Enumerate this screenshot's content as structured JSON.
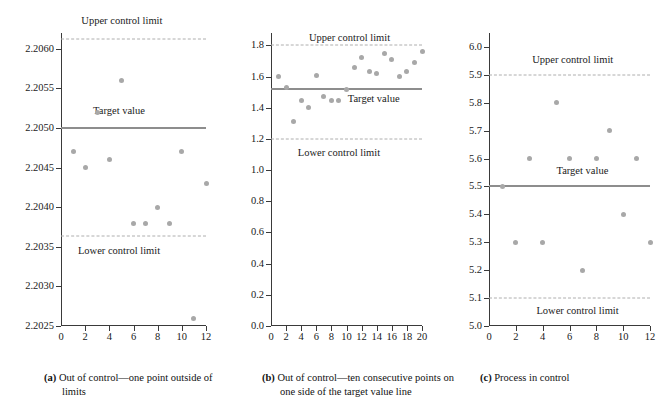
{
  "figure": {
    "background": "#ffffff",
    "point_color": "#a8a8a8",
    "target_line_color": "#8d8d8d",
    "limit_line_color": "#aeaeae",
    "axis_color": "#3a3a3a"
  },
  "labels": {
    "upper_control_limit": "Upper control limit",
    "lower_control_limit": "Lower control limit",
    "target_value": "Target value",
    "hours": "Hours"
  },
  "captions": {
    "a": {
      "label": "(a)",
      "text": "Out of control—one point outside of limits"
    },
    "b": {
      "label": "(b)",
      "text": "Out of control—ten consecutive points on one side of the target value line"
    },
    "c": {
      "label": "(c)",
      "text": "Process in control"
    }
  },
  "chart_data": [
    {
      "id": "panel-a",
      "type": "scatter",
      "title": "",
      "xlabel": "Hours",
      "ylabel": "",
      "xlim": [
        0,
        12
      ],
      "ylim": [
        2.2025,
        2.2062
      ],
      "xticks": [
        0,
        2,
        4,
        6,
        8,
        10,
        12
      ],
      "xticklabels": [
        "0",
        "2",
        "4",
        "6",
        "8",
        "10",
        "12"
      ],
      "yticks": [
        2.2025,
        2.203,
        2.2035,
        2.204,
        2.2045,
        2.205,
        2.2055,
        2.206
      ],
      "yticklabels": [
        "2.2025",
        "2.2030",
        "2.2035",
        "2.2040",
        "2.2045",
        "2.2050",
        "2.2055",
        "2.2060"
      ],
      "grid": false,
      "target_value": 2.205,
      "upper_control_limit": 2.20613,
      "lower_control_limit": 2.20364,
      "x": [
        1,
        2,
        3,
        4,
        5,
        6,
        7,
        8,
        9,
        10,
        11,
        12
      ],
      "values": [
        2.2047,
        2.2045,
        2.2052,
        2.2046,
        2.2056,
        2.2038,
        2.2038,
        2.204,
        2.2038,
        2.2047,
        2.2026,
        2.2043
      ],
      "annotations": [
        "Upper control limit",
        "Target value",
        "Lower control limit"
      ]
    },
    {
      "id": "panel-b",
      "type": "scatter",
      "title": "",
      "xlabel": "Hours",
      "ylabel": "",
      "xlim": [
        0,
        20
      ],
      "ylim": [
        0.0,
        1.88
      ],
      "xticks": [
        0,
        2,
        4,
        6,
        8,
        10,
        12,
        14,
        16,
        18,
        20
      ],
      "xticklabels": [
        "0",
        "2",
        "4",
        "6",
        "8",
        "10",
        "12",
        "14",
        "16",
        "18",
        "20"
      ],
      "yticks": [
        0.0,
        0.2,
        0.4,
        0.6,
        0.8,
        1.0,
        1.2,
        1.4,
        1.6,
        1.8
      ],
      "yticklabels": [
        "0.0",
        "0.2",
        "0.4",
        "0.6",
        "0.8",
        "1.0",
        "1.2",
        "1.4",
        "1.6",
        "1.8"
      ],
      "grid": false,
      "target_value": 1.52,
      "upper_control_limit": 1.8,
      "lower_control_limit": 1.2,
      "x": [
        1,
        2,
        3,
        4,
        5,
        6,
        7,
        8,
        9,
        10,
        11,
        12,
        13,
        14,
        15,
        16,
        17,
        18,
        19,
        20
      ],
      "values": [
        1.6,
        1.53,
        1.31,
        1.45,
        1.4,
        1.61,
        1.47,
        1.45,
        1.45,
        1.52,
        1.66,
        1.72,
        1.63,
        1.62,
        1.75,
        1.71,
        1.6,
        1.63,
        1.69,
        1.76
      ],
      "annotations": [
        "Upper control limit",
        "Target value",
        "Lower control limit"
      ]
    },
    {
      "id": "panel-c",
      "type": "scatter",
      "title": "",
      "xlabel": "Hours",
      "ylabel": "",
      "xlim": [
        0,
        12
      ],
      "ylim": [
        5.0,
        6.05
      ],
      "xticks": [
        0,
        2,
        4,
        6,
        8,
        10,
        12
      ],
      "xticklabels": [
        "0",
        "2",
        "4",
        "6",
        "8",
        "10",
        "12"
      ],
      "yticks": [
        5.0,
        5.1,
        5.2,
        5.3,
        5.4,
        5.5,
        5.6,
        5.7,
        5.8,
        5.9,
        6.0
      ],
      "yticklabels": [
        "5.0",
        "5.1",
        "5.2",
        "5.3",
        "5.4",
        "5.5",
        "5.6",
        "5.7",
        "5.8",
        "5.9",
        "6.0"
      ],
      "grid": false,
      "target_value": 5.5,
      "upper_control_limit": 5.9,
      "lower_control_limit": 5.1,
      "x": [
        1,
        2,
        3,
        4,
        5,
        6,
        7,
        8,
        9,
        10,
        11,
        12
      ],
      "values": [
        5.5,
        5.3,
        5.6,
        5.3,
        5.8,
        5.6,
        5.2,
        5.6,
        5.7,
        5.4,
        5.6,
        5.3
      ],
      "annotations": [
        "Upper control limit",
        "Target value",
        "Lower control limit"
      ]
    }
  ],
  "annotation_positions": {
    "panel-a": {
      "upper": {
        "x_frac": 0.42,
        "y_val": 2.20635
      },
      "target": {
        "x_frac": 0.4,
        "y_val": 2.20522
      },
      "lower": {
        "x_frac": 0.4,
        "y_val": 2.20345
      }
    },
    "panel-b": {
      "upper": {
        "x_frac": 0.52,
        "y_val": 1.845
      },
      "target": {
        "x_frac": 0.68,
        "y_val": 1.455
      },
      "lower": {
        "x_frac": 0.45,
        "y_val": 1.11
      }
    },
    "panel-c": {
      "upper": {
        "x_frac": 0.52,
        "y_val": 5.955
      },
      "target": {
        "x_frac": 0.58,
        "y_val": 5.555
      },
      "lower": {
        "x_frac": 0.55,
        "y_val": 5.052
      }
    }
  }
}
